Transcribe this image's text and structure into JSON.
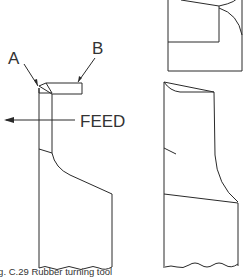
{
  "figure": {
    "labels": {
      "a": "A",
      "b": "B",
      "feed": "FEED"
    },
    "caption": "ig. C.29  Rubber turning tool",
    "views": [
      "side-view-left",
      "top-view-right",
      "front-view-right"
    ]
  }
}
